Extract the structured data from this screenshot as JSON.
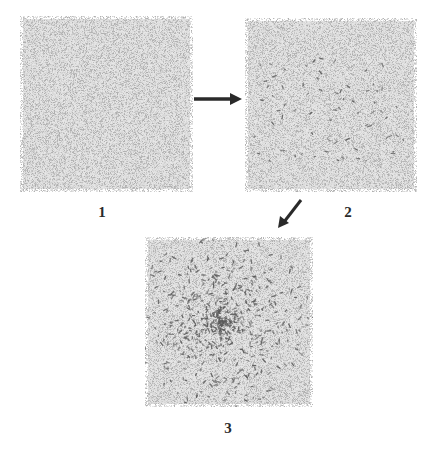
{
  "figure": {
    "panels": [
      {
        "id": 1,
        "label": "1",
        "x": 20,
        "y": 16,
        "w": 173,
        "h": 176,
        "base_density": 0.55,
        "dark_marks": 0,
        "cluster": false
      },
      {
        "id": 2,
        "label": "2",
        "x": 245,
        "y": 18,
        "w": 172,
        "h": 174,
        "base_density": 0.55,
        "dark_marks": 70,
        "cluster": false
      },
      {
        "id": 3,
        "label": "3",
        "x": 145,
        "y": 237,
        "w": 168,
        "h": 170,
        "base_density": 0.55,
        "dark_marks": 900,
        "cluster": true
      }
    ],
    "arrows": [
      {
        "from": "1",
        "to": "2",
        "direction": "right"
      },
      {
        "from": "2",
        "to": "3",
        "direction": "down-left"
      }
    ],
    "colors": {
      "background": "#ffffff",
      "speckle_light": "#b8b8b8",
      "speckle_base": "#e6e6e6",
      "dark_mark": "#5a5a5a",
      "arrow": "#2a2a2a",
      "label": "#2a2a2a"
    }
  }
}
